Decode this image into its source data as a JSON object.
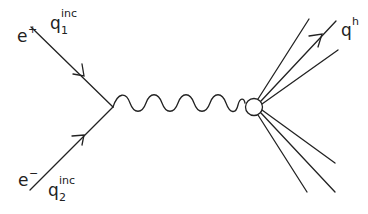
{
  "diagram": {
    "type": "feynman",
    "incoming": [
      {
        "particle": "e+",
        "momentum": "q",
        "momentum_sup": "inc",
        "momentum_sub": "1"
      },
      {
        "particle": "e−",
        "momentum": "q",
        "momentum_sup": "inc",
        "momentum_sub": "2"
      }
    ],
    "propagator": "photon (wavy line)",
    "outgoing": {
      "label": "q",
      "label_sup": "h",
      "jet_count": 6
    },
    "labels": {
      "e_plus": "e",
      "e_plus_sup": "+",
      "e_minus": "e",
      "e_minus_sup": "−",
      "q1": "q",
      "q1_sup": "inc",
      "q1_sub": "1",
      "q2": "q",
      "q2_sup": "inc",
      "q2_sub": "2",
      "qh": "q",
      "qh_sup": "h"
    },
    "line_color": "#222222"
  }
}
